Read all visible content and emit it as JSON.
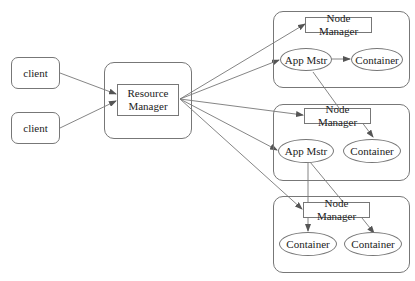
{
  "diagram": {
    "clients": [
      {
        "label": "client"
      },
      {
        "label": "client"
      }
    ],
    "resource_manager": {
      "line1": "Resource",
      "line2": "Manager"
    },
    "nodes": [
      {
        "node_manager": "Node Manager",
        "components": [
          {
            "type": "ellipse",
            "label": "App Mstr"
          },
          {
            "type": "ellipse",
            "label": "Container"
          }
        ]
      },
      {
        "node_manager": "Node Manager",
        "components": [
          {
            "type": "ellipse",
            "label": "App Mstr"
          },
          {
            "type": "ellipse",
            "label": "Container"
          }
        ]
      },
      {
        "node_manager": "Node Manager",
        "components": [
          {
            "type": "ellipse",
            "label": "Container"
          },
          {
            "type": "ellipse",
            "label": "Container"
          }
        ]
      }
    ],
    "colors": {
      "stroke": "#777777",
      "text": "#222222",
      "background": "#ffffff"
    }
  }
}
